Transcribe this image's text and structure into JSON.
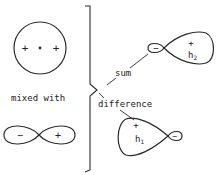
{
  "diagram": {
    "labels": {
      "mixed_with": "mixed with",
      "sum": "sum",
      "difference": "difference"
    },
    "s_orbital": {
      "signs": [
        "+",
        "•",
        "+"
      ]
    },
    "p_orbital": {
      "left_sign": "−",
      "right_sign": "+"
    },
    "hybrid_h2": {
      "label": "h",
      "subscript": "2",
      "big_lobe_sign": "+",
      "small_lobe_sign": "−"
    },
    "hybrid_h1": {
      "label": "h",
      "subscript": "1",
      "big_lobe_sign": "+",
      "small_lobe_sign": "−"
    },
    "colors": {
      "line": "#2a2a2a",
      "background": "#ffffff"
    }
  }
}
